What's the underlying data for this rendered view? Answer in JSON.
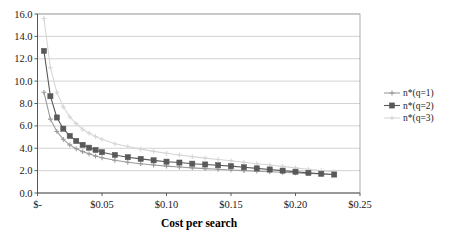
{
  "chart_data": {
    "type": "line",
    "title": "",
    "xlabel": "Cost per search",
    "ylabel": "",
    "xlim": [
      0,
      0.25
    ],
    "ylim": [
      0,
      16
    ],
    "xticks": [
      0,
      0.05,
      0.1,
      0.15,
      0.2,
      0.25
    ],
    "xticklabels": [
      "$-",
      "$0.05",
      "$0.10",
      "$0.15",
      "$0.20",
      "$0.25"
    ],
    "yticks": [
      0,
      2,
      4,
      6,
      8,
      10,
      12,
      14,
      16
    ],
    "yticklabels": [
      "0.0",
      "2.0",
      "4.0",
      "6.0",
      "8.0",
      "10.0",
      "12.0",
      "14.0",
      "16.0"
    ],
    "grid": "horizontal",
    "legend_position": "right",
    "series": [
      {
        "name": "n*(q=1)",
        "color": "#9a9a9a",
        "marker": "plus",
        "x": [
          0.005,
          0.01,
          0.015,
          0.02,
          0.025,
          0.03,
          0.035,
          0.04,
          0.045,
          0.05,
          0.06,
          0.07,
          0.08,
          0.09,
          0.1,
          0.11,
          0.12,
          0.13,
          0.14,
          0.15,
          0.16,
          0.17,
          0.18,
          0.19,
          0.2,
          0.21,
          0.22,
          0.23
        ],
        "values": [
          9.0,
          6.6,
          5.5,
          4.8,
          4.3,
          3.95,
          3.7,
          3.5,
          3.3,
          3.15,
          2.92,
          2.75,
          2.62,
          2.5,
          2.4,
          2.32,
          2.25,
          2.18,
          2.12,
          2.06,
          2.0,
          1.95,
          1.9,
          1.85,
          1.8,
          1.75,
          1.7,
          1.65
        ]
      },
      {
        "name": "n*(q=2)",
        "color": "#595959",
        "marker": "square",
        "x": [
          0.005,
          0.01,
          0.015,
          0.02,
          0.025,
          0.03,
          0.035,
          0.04,
          0.045,
          0.05,
          0.06,
          0.07,
          0.08,
          0.09,
          0.1,
          0.11,
          0.12,
          0.13,
          0.14,
          0.15,
          0.16,
          0.17,
          0.18,
          0.19,
          0.2,
          0.21,
          0.22,
          0.23
        ],
        "values": [
          12.7,
          8.65,
          6.75,
          5.75,
          5.1,
          4.65,
          4.3,
          4.05,
          3.85,
          3.65,
          3.4,
          3.2,
          3.05,
          2.92,
          2.8,
          2.72,
          2.62,
          2.55,
          2.48,
          2.4,
          2.3,
          2.2,
          2.1,
          2.0,
          1.9,
          1.8,
          1.72,
          1.65
        ]
      },
      {
        "name": "n*(q=3)",
        "color": "#d6d6d6",
        "marker": "plus",
        "x": [
          0.005,
          0.01,
          0.015,
          0.02,
          0.025,
          0.03,
          0.035,
          0.04,
          0.045,
          0.05,
          0.06,
          0.07,
          0.08,
          0.09,
          0.1,
          0.11,
          0.12,
          0.13,
          0.14,
          0.15,
          0.16,
          0.17,
          0.18,
          0.19,
          0.2,
          0.21,
          0.22,
          0.23
        ],
        "values": [
          15.6,
          11.2,
          9.0,
          7.7,
          6.8,
          6.2,
          5.7,
          5.35,
          5.05,
          4.8,
          4.4,
          4.15,
          3.92,
          3.72,
          3.55,
          3.4,
          3.25,
          3.12,
          3.0,
          2.88,
          2.75,
          2.62,
          2.5,
          2.38,
          2.25,
          2.12,
          2.0,
          1.9
        ]
      }
    ]
  },
  "legend": {
    "entries": [
      {
        "label": "n*(q=1)"
      },
      {
        "label": "n*(q=2)"
      },
      {
        "label": "n*(q=3)"
      }
    ]
  }
}
